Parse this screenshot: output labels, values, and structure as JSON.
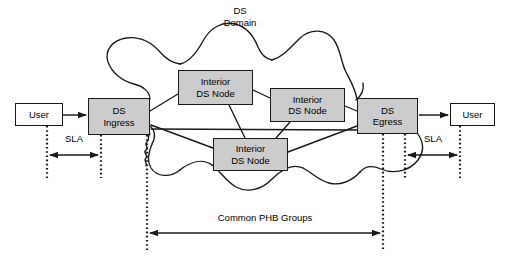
{
  "diagram": {
    "colors": {
      "node_fill": "#cccccc",
      "node_stroke": "#1a1a1a",
      "user_fill": "#ffffff",
      "line": "#1a1a1a",
      "background": "#ffffff"
    },
    "labels": {
      "ds_domain": "DS\nDomain",
      "common_phb_groups": "Common PHB Groups",
      "sla_left": "SLA",
      "sla_right": "SLA"
    },
    "nodes": [
      {
        "id": "user-left",
        "label": "User",
        "type": "user",
        "x": 15,
        "y": 103,
        "w": 48,
        "h": 23
      },
      {
        "id": "ds-ingress",
        "label": "DS\nIngress",
        "type": "edge",
        "x": 88,
        "y": 98,
        "w": 62,
        "h": 37
      },
      {
        "id": "interior-top-left",
        "label": "Interior\nDS Node",
        "type": "interior",
        "x": 178,
        "y": 70,
        "w": 75,
        "h": 35
      },
      {
        "id": "interior-top-right",
        "label": "Interior\nDS Node",
        "type": "interior",
        "x": 270,
        "y": 88,
        "w": 75,
        "h": 34
      },
      {
        "id": "interior-bottom",
        "label": "Interior\nDS Node",
        "type": "interior",
        "x": 213,
        "y": 138,
        "w": 75,
        "h": 33
      },
      {
        "id": "ds-egress",
        "label": "DS\nEgress",
        "type": "edge",
        "x": 357,
        "y": 98,
        "w": 61,
        "h": 36
      },
      {
        "id": "user-right",
        "label": "User",
        "type": "user",
        "x": 450,
        "y": 103,
        "w": 45,
        "h": 23
      }
    ],
    "node_labels": {
      "user_left": "User",
      "user_right": "User",
      "ds_ingress_line1": "DS",
      "ds_ingress_line2": "Ingress",
      "ds_egress_line1": "DS",
      "ds_egress_line2": "Egress",
      "interior_line1": "Interior",
      "interior_line2": "DS Node"
    },
    "measure_spans": [
      {
        "id": "sla-left",
        "label": "SLA",
        "from_x": 47,
        "to_x": 101,
        "y": 155
      },
      {
        "id": "sla-right",
        "label": "SLA",
        "from_x": 405,
        "to_x": 460,
        "y": 155
      },
      {
        "id": "phb-groups",
        "label": "Common PHB Groups",
        "from_x": 147,
        "to_x": 383,
        "y": 233
      }
    ]
  }
}
